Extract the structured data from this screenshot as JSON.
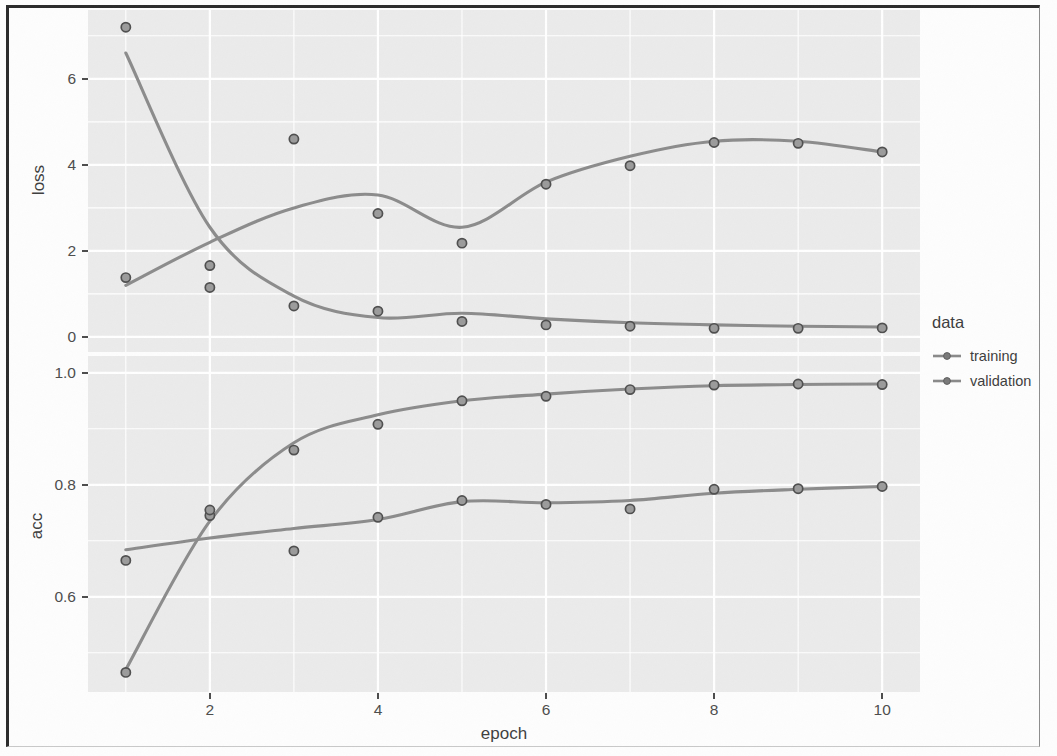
{
  "legend": {
    "title": "data",
    "items": [
      {
        "label": "training",
        "color": "#8a8a8a"
      },
      {
        "label": "validation",
        "color": "#8a8a8a"
      }
    ]
  },
  "axes": {
    "x_title": "epoch",
    "x_ticks": [
      "2",
      "4",
      "6",
      "8",
      "10"
    ],
    "loss_title": "loss",
    "loss_ticks": [
      "0",
      "2",
      "4",
      "6"
    ],
    "acc_title": "acc",
    "acc_ticks": [
      "0.6",
      "0.8",
      "1.0"
    ]
  },
  "style": {
    "panel_bg": "#ebebeb",
    "gridline": "#ffffff",
    "point_color": "#6e6e6e",
    "line_color": "#8c8c8c",
    "text_color": "#4d4d4d"
  },
  "chart_data": {
    "type": "line",
    "title": "",
    "xlabel": "epoch",
    "facets": [
      {
        "name": "loss",
        "ylabel": "loss",
        "ylim": [
          -0.35,
          7.6
        ],
        "yticks": [
          0,
          2,
          4,
          6
        ],
        "grid": true,
        "series": [
          {
            "name": "training",
            "x": [
              1,
              2,
              3,
              4,
              5,
              6,
              7,
              8,
              9,
              10
            ],
            "values": [
              7.2,
              1.15,
              0.72,
              0.6,
              0.36,
              0.28,
              0.25,
              0.2,
              0.2,
              0.21
            ],
            "smooth": [
              6.6,
              2.55,
              0.95,
              0.45,
              0.55,
              0.42,
              0.33,
              0.28,
              0.25,
              0.23
            ]
          },
          {
            "name": "validation",
            "x": [
              1,
              2,
              3,
              4,
              5,
              6,
              7,
              8,
              9,
              10
            ],
            "values": [
              1.38,
              1.66,
              4.6,
              2.87,
              2.18,
              3.55,
              3.98,
              4.52,
              4.5,
              4.3
            ],
            "smooth": [
              1.2,
              2.2,
              3.0,
              3.3,
              2.55,
              3.6,
              4.2,
              4.55,
              4.55,
              4.3
            ]
          }
        ]
      },
      {
        "name": "acc",
        "ylabel": "acc",
        "ylim": [
          0.43,
          1.03
        ],
        "yticks": [
          0.6,
          0.8,
          1.0
        ],
        "grid": true,
        "series": [
          {
            "name": "training",
            "x": [
              1,
              2,
              3,
              4,
              5,
              6,
              7,
              8,
              9,
              10
            ],
            "values": [
              0.465,
              0.745,
              0.862,
              0.908,
              0.95,
              0.958,
              0.97,
              0.978,
              0.98,
              0.979
            ],
            "smooth": [
              0.47,
              0.735,
              0.875,
              0.925,
              0.95,
              0.962,
              0.971,
              0.977,
              0.979,
              0.98
            ]
          },
          {
            "name": "validation",
            "x": [
              1,
              2,
              3,
              4,
              5,
              6,
              7,
              8,
              9,
              10
            ],
            "values": [
              0.665,
              0.755,
              0.682,
              0.742,
              0.772,
              0.765,
              0.757,
              0.792,
              0.793,
              0.797
            ],
            "smooth": [
              0.684,
              0.705,
              0.722,
              0.738,
              0.77,
              0.768,
              0.772,
              0.785,
              0.792,
              0.797
            ]
          }
        ]
      }
    ]
  }
}
